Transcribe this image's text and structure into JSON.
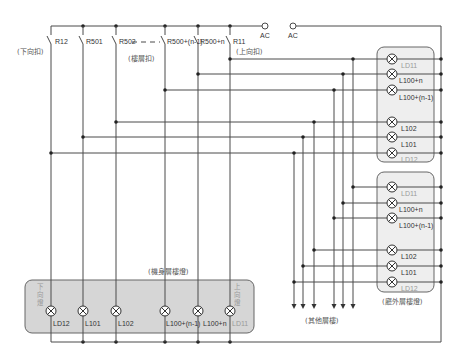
{
  "diagram": {
    "supply": {
      "ac_left": "AC",
      "ac_right": "AC"
    },
    "switches": [
      {
        "label": "R12"
      },
      {
        "label": "R501"
      },
      {
        "label": "R502"
      },
      {
        "label": "R500+(n-1)"
      },
      {
        "label": "R500+n"
      },
      {
        "label": "R11"
      }
    ],
    "switch_group_labels": {
      "down": "(下向扣)",
      "floor": "(樓層扣)",
      "up": "(上向扣)"
    },
    "car_panel": {
      "title": "(機身層樓燈)",
      "down_indicator_chars": [
        "下",
        "向",
        "燈"
      ],
      "up_indicator_chars": [
        "上",
        "向",
        "燈"
      ],
      "lamps": [
        {
          "label": "LD12"
        },
        {
          "label": "L101"
        },
        {
          "label": "L102"
        },
        {
          "label": "L100+(n-1)"
        },
        {
          "label": "L100+n"
        },
        {
          "label": "LD11"
        }
      ]
    },
    "hall_panels": [
      {
        "lamps": [
          {
            "label": "LD11"
          },
          {
            "label": "L100+n"
          },
          {
            "label": "L100+(n-1)"
          },
          {
            "label": "L102"
          },
          {
            "label": "L101"
          },
          {
            "label": "LD12"
          }
        ]
      },
      {
        "lamps": [
          {
            "label": "LD11"
          },
          {
            "label": "L100+n"
          },
          {
            "label": "L100+(n-1)"
          },
          {
            "label": "L102"
          },
          {
            "label": "L101"
          },
          {
            "label": "LD12"
          }
        ]
      }
    ],
    "hall_panel_caption": "(廳外層樓燈)",
    "other_floors_label": "(其他層樓)"
  }
}
